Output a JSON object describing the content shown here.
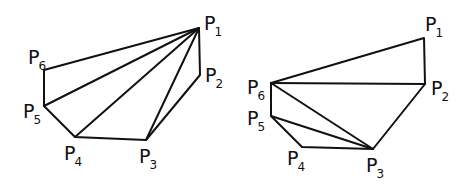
{
  "figure": {
    "line_color": "#111111",
    "background": "#ffffff"
  },
  "left": {
    "name": "fan-triangulation-from-P1",
    "vertices": [
      {
        "id": "P1",
        "base": "P",
        "sub": "1",
        "x": 199,
        "y": 28,
        "lx": 204,
        "ly": 30
      },
      {
        "id": "P2",
        "base": "P",
        "sub": "2",
        "x": 200,
        "y": 75,
        "lx": 205,
        "ly": 82
      },
      {
        "id": "P3",
        "base": "P",
        "sub": "3",
        "x": 146,
        "y": 140,
        "lx": 139,
        "ly": 163
      },
      {
        "id": "P4",
        "base": "P",
        "sub": "4",
        "x": 75,
        "y": 137,
        "lx": 64,
        "ly": 160
      },
      {
        "id": "P5",
        "base": "P",
        "sub": "5",
        "x": 44,
        "y": 106,
        "lx": 23,
        "ly": 118
      },
      {
        "id": "P6",
        "base": "P",
        "sub": "6",
        "x": 44,
        "y": 70,
        "lx": 28,
        "ly": 64
      }
    ],
    "diagonals": [
      [
        "P1",
        "P5"
      ],
      [
        "P1",
        "P4"
      ],
      [
        "P1",
        "P3"
      ]
    ]
  },
  "right": {
    "name": "alternate-triangulation",
    "vertices": [
      {
        "id": "P1",
        "base": "P",
        "sub": "1",
        "x": 424,
        "y": 38,
        "lx": 425,
        "ly": 31
      },
      {
        "id": "P2",
        "base": "P",
        "sub": "2",
        "x": 425,
        "y": 84,
        "lx": 431,
        "ly": 95
      },
      {
        "id": "P3",
        "base": "P",
        "sub": "3",
        "x": 373,
        "y": 149,
        "lx": 366,
        "ly": 172
      },
      {
        "id": "P4",
        "base": "P",
        "sub": "4",
        "x": 302,
        "y": 147,
        "lx": 287,
        "ly": 165
      },
      {
        "id": "P5",
        "base": "P",
        "sub": "5",
        "x": 271,
        "y": 116,
        "lx": 247,
        "ly": 125
      },
      {
        "id": "P6",
        "base": "P",
        "sub": "6",
        "x": 271,
        "y": 83,
        "lx": 247,
        "ly": 94
      }
    ],
    "diagonals": [
      [
        "P6",
        "P2"
      ],
      [
        "P6",
        "P3"
      ],
      [
        "P5",
        "P3"
      ]
    ]
  }
}
